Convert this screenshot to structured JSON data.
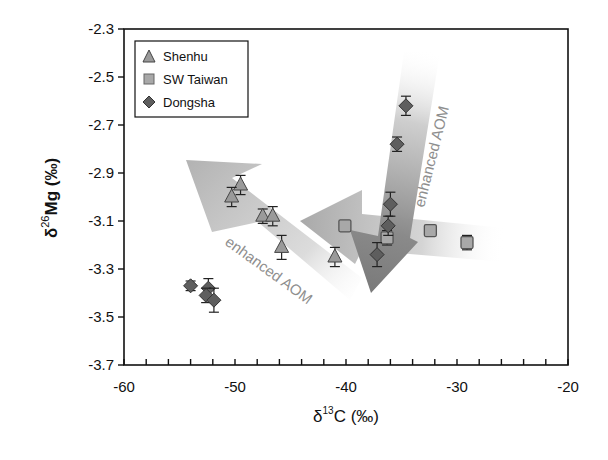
{
  "chart_data": {
    "type": "scatter",
    "title": "",
    "xlabel": "δ13C (‰)",
    "ylabel": "δ26Mg (‰)",
    "xlim": [
      -60,
      -20
    ],
    "ylim": [
      -3.7,
      -2.3
    ],
    "x_ticks": [
      -60,
      -50,
      -40,
      -30,
      -20
    ],
    "x_tick_labels": [
      "-60",
      "-50",
      "-40",
      "-30",
      "-20"
    ],
    "x_minor_tick_step": 2,
    "y_ticks": [
      -2.3,
      -2.5,
      -2.7,
      -2.9,
      -3.1,
      -3.3,
      -3.5,
      -3.7
    ],
    "y_tick_labels": [
      "-2.3",
      "-2.5",
      "-2.7",
      "-2.9",
      "-3.1",
      "-3.3",
      "-3.5",
      "-3.7"
    ],
    "grid": false,
    "legend_position": "upper-left",
    "series": [
      {
        "name": "Shenhu",
        "marker": "triangle",
        "color": "#9a9a9a",
        "points": [
          {
            "x": -49.5,
            "y": -2.95,
            "err": 0.04
          },
          {
            "x": -50.3,
            "y": -3.0,
            "err": 0.04
          },
          {
            "x": -47.5,
            "y": -3.08,
            "err": 0.03
          },
          {
            "x": -46.6,
            "y": -3.08,
            "err": 0.04
          },
          {
            "x": -45.8,
            "y": -3.21,
            "err": 0.05
          },
          {
            "x": -41.0,
            "y": -3.25,
            "err": 0.04
          }
        ]
      },
      {
        "name": "SW Taiwan",
        "marker": "square",
        "color": "#a8a8a8",
        "points": [
          {
            "x": -40.1,
            "y": -3.12,
            "err": 0.02
          },
          {
            "x": -36.3,
            "y": -3.17,
            "err": 0.03
          },
          {
            "x": -32.4,
            "y": -3.14,
            "err": 0.02
          },
          {
            "x": -29.1,
            "y": -3.19,
            "err": 0.03
          }
        ]
      },
      {
        "name": "Dongsha",
        "marker": "diamond",
        "color": "#5e5e5e",
        "points": [
          {
            "x": -54.0,
            "y": -3.37,
            "err": 0.02
          },
          {
            "x": -52.4,
            "y": -3.38,
            "err": 0.04
          },
          {
            "x": -52.6,
            "y": -3.41,
            "err": 0.03
          },
          {
            "x": -51.9,
            "y": -3.43,
            "err": 0.05
          },
          {
            "x": -34.6,
            "y": -2.62,
            "err": 0.04
          },
          {
            "x": -35.4,
            "y": -2.78,
            "err": 0.03
          },
          {
            "x": -36.0,
            "y": -3.03,
            "err": 0.05
          },
          {
            "x": -36.2,
            "y": -3.12,
            "err": 0.04
          },
          {
            "x": -37.2,
            "y": -3.24,
            "err": 0.05
          }
        ]
      }
    ],
    "annotations": [
      {
        "text": "enhanced AOM",
        "arrow_direction": "up-left",
        "note": "Shenhu trend arrow"
      },
      {
        "text": "enhanced AOM",
        "arrow_direction": "down",
        "note": "Dongsha trend arrow"
      },
      {
        "text": "",
        "arrow_direction": "left",
        "note": "SW Taiwan trend arrow"
      }
    ]
  },
  "legend": {
    "items": [
      {
        "label": "Shenhu",
        "marker": "triangle"
      },
      {
        "label": "SW Taiwan",
        "marker": "square"
      },
      {
        "label": "Dongsha",
        "marker": "diamond"
      }
    ]
  },
  "axes": {
    "x_title_main": "δ",
    "x_title_sup": "13",
    "x_title_rest": "C (‰)",
    "y_title_main": "δ",
    "y_title_sup": "26",
    "y_title_rest": "Mg (‰)"
  },
  "annotations": {
    "arrow1_label": "enhanced AOM",
    "arrow2_label": "enhanced AOM"
  }
}
